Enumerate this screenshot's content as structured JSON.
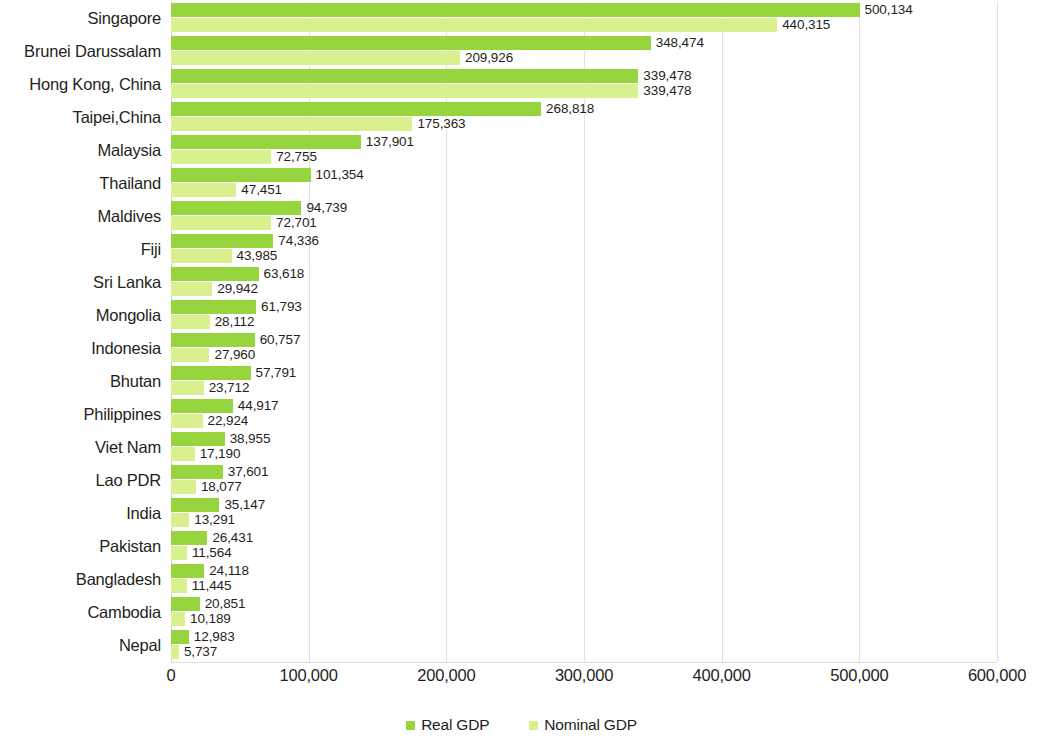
{
  "chart_data": {
    "type": "bar",
    "orientation": "horizontal",
    "title": "",
    "xlabel": "",
    "ylabel": "",
    "xlim": [
      0,
      600000
    ],
    "grid": true,
    "legend_position": "bottom",
    "categories": [
      "Singapore",
      "Brunei Darussalam",
      "Hong Kong, China",
      "Taipei,China",
      "Malaysia",
      "Thailand",
      "Maldives",
      "Fiji",
      "Sri Lanka",
      "Mongolia",
      "Indonesia",
      "Bhutan",
      "Philippines",
      "Viet Nam",
      "Lao PDR",
      "India",
      "Pakistan",
      "Bangladesh",
      "Cambodia",
      "Nepal"
    ],
    "series": [
      {
        "name": "Real GDP",
        "color": "#96d53e",
        "values": [
          500134,
          348474,
          339478,
          268818,
          137901,
          101354,
          94739,
          74336,
          63618,
          61793,
          60757,
          57791,
          44917,
          38955,
          37601,
          35147,
          26431,
          24118,
          20851,
          12983
        ],
        "labels": [
          "500,134",
          "348,474",
          "339,478",
          "268,818",
          "137,901",
          "101,354",
          "94,739",
          "74,336",
          "63,618",
          "61,793",
          "60,757",
          "57,791",
          "44,917",
          "38,955",
          "37,601",
          "35,147",
          "26,431",
          "24,118",
          "20,851",
          "12,983"
        ]
      },
      {
        "name": "Nominal GDP",
        "color": "#d8f08d",
        "values": [
          440315,
          209926,
          339478,
          175363,
          72755,
          47451,
          72701,
          43985,
          29942,
          28112,
          27960,
          23712,
          22924,
          17190,
          18077,
          13291,
          11564,
          11445,
          10189,
          5737
        ],
        "labels": [
          "440,315",
          "209,926",
          "339,478",
          "175,363",
          "72,755",
          "47,451",
          "72,701",
          "43,985",
          "29,942",
          "28,112",
          "27,960",
          "23,712",
          "22,924",
          "17,190",
          "18,077",
          "13,291",
          "11,564",
          "11,445",
          "10,189",
          "5,737"
        ]
      }
    ],
    "xticks": [
      0,
      100000,
      200000,
      300000,
      400000,
      500000,
      600000
    ],
    "xtick_labels": [
      "0",
      "100,000",
      "200,000",
      "300,000",
      "400,000",
      "500,000",
      "600,000"
    ]
  },
  "legend": {
    "items": [
      {
        "label": "Real GDP",
        "color": "#96d53e"
      },
      {
        "label": "Nominal GDP",
        "color": "#d8f08d"
      }
    ]
  }
}
